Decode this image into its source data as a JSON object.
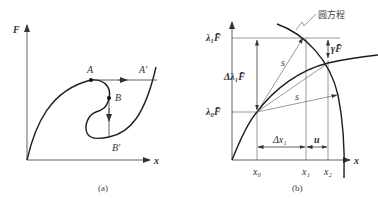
{
  "panel_a": {
    "y_axis_label": "F",
    "x_axis_label": "x",
    "points": {
      "A": "A",
      "A_prime": "A′",
      "B": "B",
      "B_prime": "B′"
    },
    "caption": "(a)"
  },
  "panel_b": {
    "y_axis_label_top": "λ₁F̄",
    "y_axis_label_bottom": "λ₀F̄",
    "delta_lambda_label": "Δλ₁F̄",
    "gamma_label": "γF̄",
    "arc_label": "圆方程",
    "s_label_1": "s",
    "s_label_2": "s",
    "delta_x_label": "Δx₁",
    "u_label": "u",
    "x_ticks": [
      "x₀",
      "x₁",
      "x₂"
    ],
    "x_axis_label": "x",
    "caption": "(b)"
  }
}
